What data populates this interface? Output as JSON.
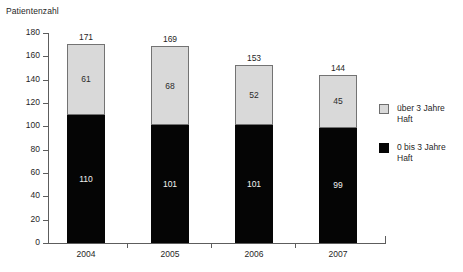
{
  "chart_data": {
    "type": "bar",
    "subtype": "stacked-vertical",
    "title": "Patientenzahl",
    "xlabel": "",
    "ylabel": "Patientenzahl",
    "ylim": [
      0,
      180
    ],
    "ytick_step": 20,
    "yticks": [
      180,
      160,
      140,
      120,
      100,
      80,
      60,
      40,
      20,
      0
    ],
    "grid": false,
    "legend_position": "right",
    "categories": [
      "2004",
      "2005",
      "2006",
      "2007"
    ],
    "series": [
      {
        "name": "0 bis 3 Jahre Haft",
        "color": "#050505",
        "values": [
          110,
          101,
          101,
          99
        ]
      },
      {
        "name": "über 3 Jahre Haft",
        "color": "#d9d9d9",
        "values": [
          61,
          68,
          52,
          45
        ]
      }
    ],
    "totals": [
      171,
      169,
      153,
      144
    ],
    "bar_labels": [
      {
        "category": "2004",
        "total": "171",
        "lower": "110",
        "upper": "61"
      },
      {
        "category": "2005",
        "total": "169",
        "lower": "101",
        "upper": "68"
      },
      {
        "category": "2006",
        "total": "153",
        "lower": "101",
        "upper": "52"
      },
      {
        "category": "2007",
        "total": "144",
        "lower": "99",
        "upper": "45"
      }
    ]
  },
  "legend": {
    "items": [
      {
        "label_line1": "über 3 Jahre",
        "label_line2": "Haft",
        "swatch": "gray"
      },
      {
        "label_line1": "0 bis 3 Jahre",
        "label_line2": "Haft",
        "swatch": "black"
      }
    ]
  },
  "colors": {
    "upper_segment": "#d9d9d9",
    "lower_segment": "#050505",
    "axis": "#5d5d5d",
    "text": "#1f1f1f",
    "background": "#ffffff"
  }
}
